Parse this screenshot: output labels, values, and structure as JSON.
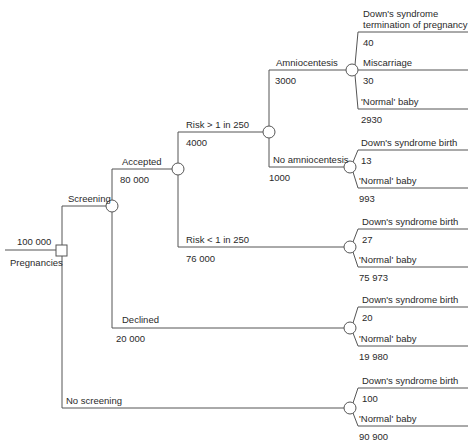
{
  "diagram": {
    "type": "decision-tree",
    "root": {
      "count": "100 000",
      "label": "Pregnancies"
    },
    "branches": {
      "screening": {
        "label": "Screening"
      },
      "accepted": {
        "label": "Accepted",
        "count": "80 000"
      },
      "risk_high": {
        "label": "Risk > 1 in 250",
        "count": "4000"
      },
      "amnio": {
        "label": "Amniocentesis",
        "count": "3000"
      },
      "no_amnio": {
        "label": "No amniocentesis",
        "count": "1000"
      },
      "risk_low": {
        "label": "Risk < 1 in 250",
        "count": "76 000"
      },
      "declined": {
        "label": "Declined",
        "count": "20 000"
      },
      "no_screening": {
        "label": "No screening"
      }
    },
    "outcomes": {
      "amnio": [
        {
          "label": "Down's syndrome termination of pregnancy",
          "line1": "Down's syndrome",
          "line2": "termination of pregnancy",
          "count": "40"
        },
        {
          "label": "Miscarriage",
          "count": "30"
        },
        {
          "label": "'Normal' baby",
          "count": "2930"
        }
      ],
      "no_amnio": [
        {
          "label": "Down's syndrome birth",
          "count": "13"
        },
        {
          "label": "'Normal' baby",
          "count": "993"
        }
      ],
      "risk_low": [
        {
          "label": "Down's syndrome birth",
          "count": "27"
        },
        {
          "label": "'Normal' baby",
          "count": "75 973"
        }
      ],
      "declined": [
        {
          "label": "Down's syndrome birth",
          "count": "20"
        },
        {
          "label": "'Normal' baby",
          "count": "19 980"
        }
      ],
      "no_screening": [
        {
          "label": "Down's syndrome birth",
          "count": "100"
        },
        {
          "label": "'Normal' baby",
          "count": "90 900"
        }
      ]
    },
    "colors": {
      "line": "#555555",
      "text": "#2a2a2a",
      "background": "#ffffff"
    }
  }
}
